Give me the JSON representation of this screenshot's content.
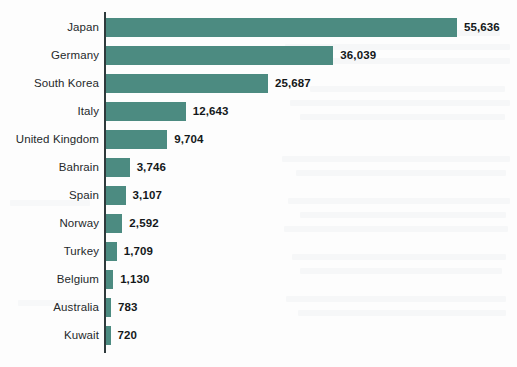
{
  "chart_data": {
    "type": "bar",
    "orientation": "horizontal",
    "title": "",
    "subtitle": "",
    "xlabel": "",
    "ylabel": "",
    "grid": false,
    "legend": null,
    "axis_max": 55636,
    "bar_color": "#4c8b81",
    "value_label_color": "#14181a",
    "category_label_color": "#25292b",
    "axis_color": "#2f3a3c",
    "categories": [
      "Japan",
      "Germany",
      "South Korea",
      "Italy",
      "United Kingdom",
      "Bahrain",
      "Spain",
      "Norway",
      "Turkey",
      "Belgium",
      "Australia",
      "Kuwait"
    ],
    "values": [
      55636,
      36039,
      25687,
      12643,
      9704,
      3746,
      3107,
      2592,
      1709,
      1130,
      783,
      720
    ],
    "value_labels": [
      "55,636",
      "36,039",
      "25,687",
      "12,643",
      "9,704",
      "3,746",
      "3,107",
      "2,592",
      "1,709",
      "1,130",
      "783",
      "720"
    ]
  }
}
